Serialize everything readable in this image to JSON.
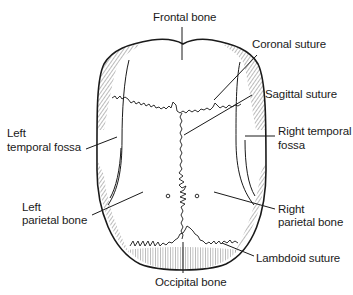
{
  "diagram": {
    "labels": [
      {
        "id": "frontal",
        "text": "Frontal bone"
      },
      {
        "id": "coronal",
        "text": "Coronal suture"
      },
      {
        "id": "sagittal",
        "text": "Sagittal suture"
      },
      {
        "id": "left_temporal_1",
        "text": "Left"
      },
      {
        "id": "left_temporal_2",
        "text": "temporal fossa"
      },
      {
        "id": "right_temporal_1",
        "text": "Right temporal"
      },
      {
        "id": "right_temporal_2",
        "text": "fossa"
      },
      {
        "id": "left_parietal_1",
        "text": "Left"
      },
      {
        "id": "left_parietal_2",
        "text": "parietal bone"
      },
      {
        "id": "right_parietal_1",
        "text": "Right"
      },
      {
        "id": "right_parietal_2",
        "text": "parietal bone"
      },
      {
        "id": "lambdoid",
        "text": "Lambdoid suture"
      },
      {
        "id": "occipital",
        "text": "Occipital bone"
      }
    ],
    "colors": {
      "line": "#1a1a1a",
      "hatch": "#555555",
      "background": "#ffffff"
    }
  }
}
